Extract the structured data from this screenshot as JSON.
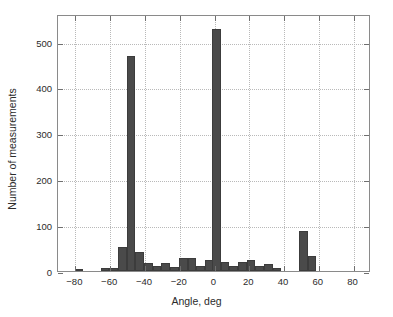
{
  "chart_data": {
    "type": "bar",
    "title": "",
    "subtitle": "",
    "xlabel": "Angle, deg",
    "ylabel": "Number of measurements",
    "xlim": [
      -90,
      90
    ],
    "ylim": [
      0,
      560
    ],
    "xticks": [
      -80,
      -60,
      -40,
      -20,
      0,
      20,
      40,
      60,
      80
    ],
    "xtick_labels": [
      "−80",
      "−60",
      "−40",
      "−20",
      "0",
      "20",
      "40",
      "60",
      "80"
    ],
    "yticks": [
      0,
      100,
      200,
      300,
      400,
      500
    ],
    "ytick_labels": [
      "0",
      "100",
      "200",
      "300",
      "400",
      "500"
    ],
    "grid": true,
    "grid_style": "dotted",
    "legend": null,
    "bar_color": "#4a4a4a",
    "bar_edge_color": "#3c3c3c",
    "axes_color": "#8a8a8a",
    "grid_color": "#b9b9b9",
    "background": "#ffffff",
    "bin_width": 5,
    "categories": [
      -80,
      -75,
      -70,
      -65,
      -60,
      -55,
      -50,
      -45,
      -40,
      -35,
      -30,
      -25,
      -20,
      -15,
      -10,
      -5,
      0,
      5,
      10,
      15,
      20,
      25,
      30,
      35,
      40,
      45,
      50,
      55,
      60,
      65,
      70,
      75,
      80
    ],
    "values": [
      2,
      0,
      0,
      6,
      6,
      53,
      468,
      42,
      17,
      12,
      18,
      9,
      29,
      28,
      11,
      24,
      528,
      19,
      11,
      20,
      25,
      11,
      15,
      7,
      0,
      0,
      87,
      33,
      0,
      0,
      0,
      0,
      0
    ],
    "bars": [
      {
        "center": -78,
        "value": 2
      },
      {
        "center": -63,
        "value": 6
      },
      {
        "center": -58,
        "value": 6
      },
      {
        "center": -53,
        "value": 53
      },
      {
        "center": -48,
        "value": 468
      },
      {
        "center": -43,
        "value": 42
      },
      {
        "center": -38,
        "value": 17
      },
      {
        "center": -33,
        "value": 12
      },
      {
        "center": -28,
        "value": 18
      },
      {
        "center": -23,
        "value": 9
      },
      {
        "center": -18,
        "value": 29
      },
      {
        "center": -13,
        "value": 28
      },
      {
        "center": -8,
        "value": 11
      },
      {
        "center": -3,
        "value": 24
      },
      {
        "center": 1,
        "value": 528
      },
      {
        "center": 6,
        "value": 19
      },
      {
        "center": 11,
        "value": 11
      },
      {
        "center": 16,
        "value": 20
      },
      {
        "center": 21,
        "value": 25
      },
      {
        "center": 26,
        "value": 11
      },
      {
        "center": 31,
        "value": 15
      },
      {
        "center": 36,
        "value": 7
      },
      {
        "center": 51,
        "value": 87
      },
      {
        "center": 56,
        "value": 33
      }
    ]
  }
}
